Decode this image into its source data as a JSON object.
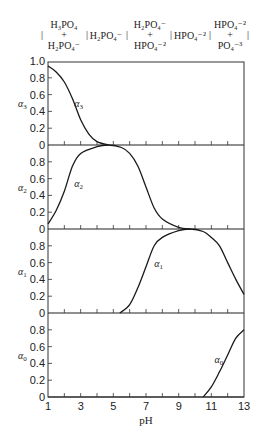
{
  "chart_data": {
    "type": "line",
    "title": "",
    "xlabel": "pH",
    "xlim": [
      1,
      13
    ],
    "x_ticks": [
      1,
      3,
      5,
      7,
      9,
      11,
      13
    ],
    "x_minor_ticks": [
      2,
      3,
      4,
      5,
      6,
      7,
      8,
      9,
      10,
      11,
      12
    ],
    "grid": false,
    "layout": "4 vertically stacked panels sharing pH axis",
    "region_labels": [
      {
        "top": "H3PO4",
        "plus": "+",
        "bottom": "H2PO4-",
        "label": "H₃PO₄ + H₂PO₄⁻"
      },
      {
        "single": "H2PO4-",
        "label": "H₂PO₄⁻"
      },
      {
        "top": "H2PO4-",
        "plus": "+",
        "bottom": "HPO4-2",
        "label": "H₂PO₄⁻ + HPO₄⁻²"
      },
      {
        "single": "HPO4-2",
        "label": "HPO₄⁻²"
      },
      {
        "top": "HPO4-2",
        "plus": "+",
        "bottom": "PO4-3",
        "label": "HPO₄⁻² + PO₄⁻³"
      }
    ],
    "panels": [
      {
        "ylabel": "α3",
        "ylim": [
          0,
          1.0
        ],
        "y_ticks": [
          "1.0",
          "0.8",
          "0.6",
          "0.4",
          "0.2",
          "0"
        ],
        "series": [
          {
            "name": "α3",
            "x": [
              1,
              1.5,
              2,
              2.5,
              3,
              3.5,
              4,
              4.7
            ],
            "values": [
              0.94,
              0.87,
              0.75,
              0.55,
              0.3,
              0.13,
              0.04,
              0.0
            ]
          }
        ]
      },
      {
        "ylabel": "α2",
        "ylim": [
          0,
          1.0
        ],
        "y_ticks": [
          "0.8",
          "0.6",
          "0.4",
          "0.2",
          "0"
        ],
        "series": [
          {
            "name": "α2",
            "x": [
              1,
              1.5,
              2,
              2.5,
              3,
              4,
              4.7,
              5.5,
              6,
              6.5,
              7,
              7.5,
              8,
              9,
              9.7
            ],
            "values": [
              0.06,
              0.22,
              0.45,
              0.75,
              0.9,
              0.98,
              1.0,
              0.97,
              0.9,
              0.75,
              0.5,
              0.25,
              0.12,
              0.02,
              0.0
            ]
          }
        ]
      },
      {
        "ylabel": "α1",
        "ylim": [
          0,
          1.0
        ],
        "y_ticks": [
          "0.8",
          "0.6",
          "0.4",
          "0.2",
          "0"
        ],
        "series": [
          {
            "name": "α1",
            "x": [
              5.4,
              6,
              6.5,
              7,
              7.5,
              8,
              9,
              9.7,
              10.5,
              11,
              11.5,
              12,
              12.5,
              13
            ],
            "values": [
              0.0,
              0.1,
              0.3,
              0.55,
              0.8,
              0.9,
              0.98,
              1.0,
              0.97,
              0.9,
              0.8,
              0.6,
              0.4,
              0.22
            ]
          }
        ]
      },
      {
        "ylabel": "α0",
        "ylim": [
          0,
          1.0
        ],
        "y_ticks": [
          "0.8",
          "0.6",
          "0.4",
          "0.2",
          "0"
        ],
        "series": [
          {
            "name": "α0",
            "x": [
              10.5,
              11,
              11.5,
              12,
              12.5,
              13
            ],
            "values": [
              0.0,
              0.12,
              0.3,
              0.5,
              0.7,
              0.8
            ]
          }
        ]
      }
    ],
    "annotations": [
      {
        "text": "α3",
        "x": 2.6,
        "y": 0.45,
        "panel": 0
      },
      {
        "text": "α2",
        "x": 2.6,
        "y": 0.5,
        "panel": 1
      },
      {
        "text": "α1",
        "x": 7.5,
        "y": 0.55,
        "panel": 2
      },
      {
        "text": "α0",
        "x": 11.2,
        "y": 0.4,
        "panel": 3
      }
    ]
  },
  "labels": {
    "xlabel": "pH",
    "x_ticks": [
      "1",
      "3",
      "5",
      "7",
      "9",
      "11",
      "13"
    ],
    "y_top": [
      "1.0",
      "0.8",
      "0.6",
      "0.4",
      "0.2",
      "0"
    ],
    "y_other": [
      "0.8",
      "0.6",
      "0.4",
      "0.2",
      "0"
    ],
    "alpha_symbol": "α",
    "subs": [
      "3",
      "2",
      "1",
      "0"
    ],
    "hdr": {
      "r1_top": "H₃PO₄",
      "r1_plus": "+",
      "r1_bot": "H₂PO₄⁻",
      "r2": "H₂PO₄⁻",
      "r3_top": "H₂PO₄⁻",
      "r3_plus": "+",
      "r3_bot": "HPO₄⁻²",
      "r4": "HPO₄⁻²",
      "r5_top": "HPO₄⁻²",
      "r5_plus": "+",
      "r5_bot": "PO₄⁻³",
      "sep": "|"
    }
  }
}
